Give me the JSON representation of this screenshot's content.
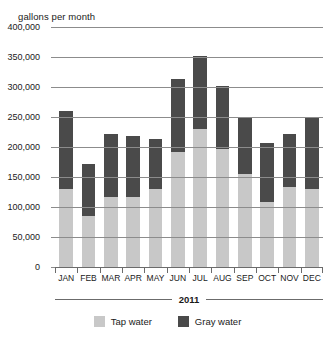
{
  "chart_data": {
    "type": "bar",
    "subtype": "stacked-vertical",
    "title": "",
    "ylabel": "gallons per month",
    "xlabel": "2011",
    "ylim": [
      0,
      400000
    ],
    "ytick_step": 50000,
    "ytick_labels": [
      "400,000",
      "350,000",
      "300,000",
      "250,000",
      "200,000",
      "150,000",
      "100,000",
      "50,000",
      "0"
    ],
    "ytick_values": [
      400000,
      350000,
      300000,
      250000,
      200000,
      150000,
      100000,
      50000,
      0
    ],
    "grid": true,
    "legend_position": "bottom",
    "categories": [
      "JAN",
      "FEB",
      "MAR",
      "APR",
      "MAY",
      "JUN",
      "JUL",
      "AUG",
      "SEP",
      "OCT",
      "NOV",
      "DEC"
    ],
    "series": [
      {
        "name": "Tap water",
        "color": "#c8c8c8",
        "values": [
          130000,
          85000,
          117000,
          117000,
          130000,
          192000,
          230000,
          196000,
          155000,
          108000,
          133000,
          130000
        ]
      },
      {
        "name": "Gray water",
        "color": "#4a4a4a",
        "values": [
          130000,
          87000,
          105000,
          101000,
          83000,
          122000,
          121000,
          106000,
          94000,
          98000,
          89000,
          120000
        ]
      }
    ],
    "totals": [
      260000,
      172000,
      222000,
      218000,
      213000,
      314000,
      351000,
      302000,
      249000,
      206000,
      222000,
      250000
    ]
  },
  "legend": {
    "items": [
      {
        "label": "Tap water",
        "color": "#c8c8c8"
      },
      {
        "label": "Gray water",
        "color": "#4a4a4a"
      }
    ]
  },
  "colors": {
    "tap_water": "#c8c8c8",
    "gray_water": "#4a4a4a",
    "gridline": "#8c8c8c",
    "axis": "#6b6b6b",
    "text": "#1a1a1a",
    "background": "#ffffff"
  }
}
